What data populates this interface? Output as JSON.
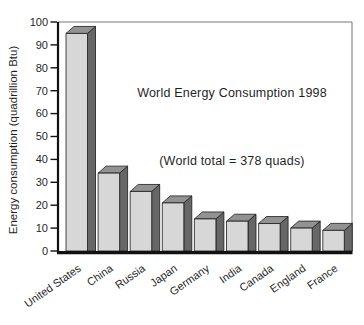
{
  "figure": {
    "background": "#ffffff"
  },
  "chart_data": {
    "type": "bar",
    "title": "World Energy Consumption 1998",
    "annotation": "(World total = 378 quads)",
    "ylabel": "Energy consumption (quadrillion Btu)",
    "xlabel": "",
    "categories": [
      "United States",
      "China",
      "Russia",
      "Japan",
      "Germany",
      "India",
      "Canada",
      "England",
      "France"
    ],
    "values": [
      95,
      34,
      26,
      21,
      14,
      13,
      12,
      10,
      9
    ],
    "ylim": [
      0,
      100
    ],
    "yticks": [
      0,
      10,
      20,
      30,
      40,
      50,
      60,
      70,
      80,
      90,
      100
    ],
    "grid": false,
    "legend": "none",
    "bar_style_3d": true,
    "style": {
      "bar_front": "#d7d7d7",
      "bar_side": "#676767",
      "bar_top": "#929292",
      "bar_outline": "#1a1a1a",
      "axis_color": "#111111",
      "border_color": "#777777",
      "text_color": "#1f1f1f"
    }
  }
}
